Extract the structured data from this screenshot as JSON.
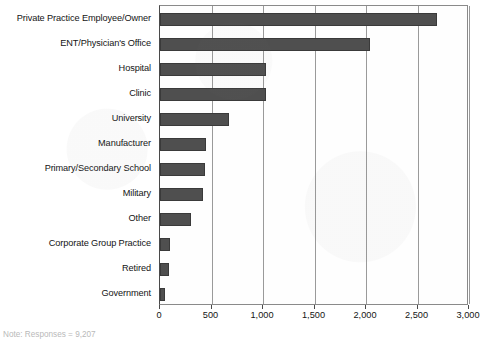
{
  "chart_data": {
    "type": "bar",
    "orientation": "horizontal",
    "title": "",
    "xlabel": "",
    "ylabel": "",
    "xlim": [
      0,
      3000
    ],
    "grid": true,
    "legend": null,
    "categories": [
      "Private Practice Employee/Owner",
      "ENT/Physician's Office",
      "Hospital",
      "Clinic",
      "University",
      "Manufacturer",
      "Primary/Secondary School",
      "Military",
      "Other",
      "Corporate Group Practice",
      "Retired",
      "Government"
    ],
    "values": [
      2690,
      2040,
      1030,
      1030,
      670,
      450,
      435,
      420,
      305,
      100,
      85,
      50
    ],
    "xticks": [
      0,
      500,
      1000,
      1500,
      2000,
      2500,
      3000
    ],
    "xtick_labels": [
      "0",
      "500",
      "1,000",
      "1,500",
      "2,000",
      "2,500",
      "3,000"
    ],
    "series": [
      {
        "name": "Responses",
        "values": [
          2690,
          2040,
          1030,
          1030,
          670,
          450,
          435,
          420,
          305,
          100,
          85,
          50
        ]
      }
    ]
  },
  "footnote": {
    "text": "Note: Responses = 9,207"
  },
  "colors": {
    "bar_fill": "#4f4f4f",
    "bar_border": "#3a3a3a",
    "gridline": "#9a9a9a",
    "axis": "#4a4a4a",
    "text": "#141414",
    "background": "#ffffff"
  }
}
